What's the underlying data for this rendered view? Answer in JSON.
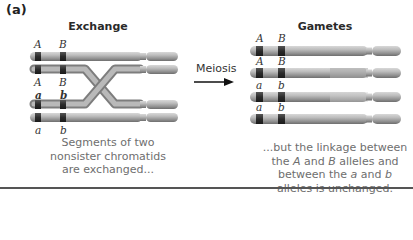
{
  "figure": {
    "panel_label": "(a)",
    "left_heading": "Exchange",
    "right_heading": "Gametes",
    "arrow_label": "Meiosis",
    "left_caption": [
      "Segments of two",
      "nonsister chromatids",
      "are exchanged..."
    ],
    "right_caption": {
      "line1": "...but the linkage between",
      "line2_pre": "the ",
      "line2_a": "A",
      "line2_mid": " and ",
      "line2_b": "B",
      "line2_post": " alleles and",
      "line3_pre": "between the ",
      "line3_a": "a",
      "line3_mid": " and ",
      "line3_b": "b",
      "line4": "alleles is unchanged."
    },
    "exchange_alleles": {
      "row1": [
        "A",
        "B"
      ],
      "row2": [
        "A",
        "B"
      ],
      "row3": [
        "a",
        "b"
      ],
      "row4": [
        "a",
        "b"
      ]
    },
    "gamete_alleles": {
      "row1": [
        "A",
        "B"
      ],
      "row2": [
        "A",
        "B"
      ],
      "row3": [
        "a",
        "b"
      ],
      "row4": [
        "a",
        "b"
      ]
    },
    "colors": {
      "chromosome": "#9a9a9a",
      "chromosome_light": "#c4c4c4",
      "band": "#2b2b2b",
      "caption_text": "#6e6e6e",
      "rule": "#555555"
    }
  }
}
